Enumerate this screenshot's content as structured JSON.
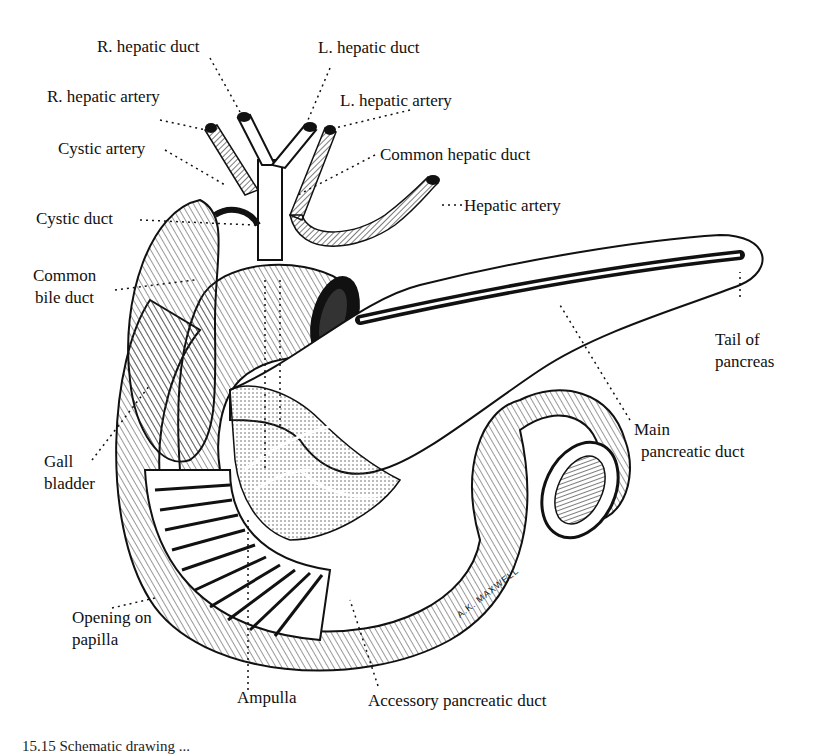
{
  "figure": {
    "labels": {
      "r_hepatic_duct": "R. hepatic duct",
      "l_hepatic_duct": "L. hepatic duct",
      "r_hepatic_artery": "R. hepatic artery",
      "l_hepatic_artery": "L. hepatic artery",
      "cystic_artery": "Cystic artery",
      "common_hepatic_duct": "Common hepatic duct",
      "hepatic_artery": "Hepatic artery",
      "cystic_duct": "Cystic duct",
      "common_bile_duct_line1": "Common",
      "common_bile_duct_line2": "bile duct",
      "tail_of_pancreas_line1": "Tail of",
      "tail_of_pancreas_line2": "pancreas",
      "main_pancreatic_duct_line1": "Main",
      "main_pancreatic_duct_line2": "pancreatic duct",
      "gall_bladder_line1": "Gall",
      "gall_bladder_line2": "bladder",
      "opening_on_papilla_line1": "Opening on",
      "opening_on_papilla_line2": "papilla",
      "ampulla": "Ampulla",
      "accessory_pancreatic_duct": "Accessory pancreatic duct"
    },
    "signature": "A.K. MAXWELL",
    "caption_partial": "15.15  Schematic drawing ..."
  }
}
